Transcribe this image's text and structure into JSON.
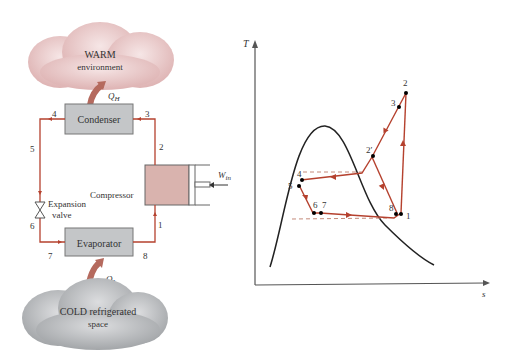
{
  "cycle_diagram": {
    "warm_cloud": {
      "line1": "WARM",
      "line2": "environment"
    },
    "cold_cloud": {
      "line1": "COLD refrigerated",
      "line2": "space"
    },
    "heat_out": "Q",
    "heat_out_sub": "H",
    "heat_in": "Q",
    "heat_in_sub": "L",
    "condenser": "Condenser",
    "evaporator": "Evaporator",
    "compressor": "Compressor",
    "valve_line1": "Expansion",
    "valve_line2": "valve",
    "work_in": "W",
    "work_in_sub": "in",
    "state_labels": [
      "1",
      "2",
      "3",
      "4",
      "5",
      "6",
      "7",
      "8"
    ]
  },
  "ts_diagram": {
    "y_axis_label": "T",
    "x_axis_label": "s",
    "points": [
      {
        "label": "1"
      },
      {
        "label": "2"
      },
      {
        "label": "2′"
      },
      {
        "label": "3"
      },
      {
        "label": "4"
      },
      {
        "label": "5"
      },
      {
        "label": "6"
      },
      {
        "label": "7"
      },
      {
        "label": "8"
      }
    ]
  },
  "colors": {
    "flow_line": "#b5412e",
    "box_fill": "#c4c6c8",
    "compressor_fill": "#d9b3ae",
    "warm_cloud": "#e8c4c4",
    "cold_cloud": "#a9abad",
    "dome": "#222222",
    "dashed": "#c48a7a"
  }
}
